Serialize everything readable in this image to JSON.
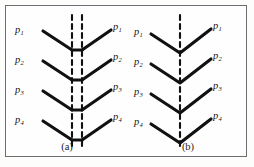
{
  "figure": {
    "background_color": "#fdfdfc",
    "frame_color": "#6b6d70",
    "stroke_color": "#111111",
    "dash_color": "#111111"
  },
  "panels": [
    {
      "id": "a",
      "caption": "(a)",
      "center_type": "double-dashed-line-with-crossbars",
      "vertex_shape": "flat-crossbar",
      "dashed_lines_x": [
        66,
        76
      ],
      "left_labels": [
        {
          "text": "p",
          "sub": "1"
        },
        {
          "text": "p",
          "sub": "2"
        },
        {
          "text": "p",
          "sub": "3"
        },
        {
          "text": "p",
          "sub": "4"
        }
      ],
      "right_labels": [
        {
          "text": "p",
          "sub": "1"
        },
        {
          "text": "p",
          "sub": "2"
        },
        {
          "text": "p",
          "sub": "3"
        },
        {
          "text": "p",
          "sub": "4"
        }
      ]
    },
    {
      "id": "b",
      "caption": "(b)",
      "center_type": "single-dashed-line",
      "vertex_shape": "sharp-point",
      "dashed_lines_x": [
        52
      ],
      "left_labels": [
        {
          "text": "p",
          "sub": "1"
        },
        {
          "text": "p",
          "sub": "2"
        },
        {
          "text": "p",
          "sub": "3"
        },
        {
          "text": "p",
          "sub": "4"
        }
      ],
      "right_labels": [
        {
          "text": "p",
          "sub": "1"
        },
        {
          "text": "p",
          "sub": "2"
        },
        {
          "text": "p",
          "sub": "3"
        },
        {
          "text": "p",
          "sub": "4"
        }
      ]
    }
  ]
}
